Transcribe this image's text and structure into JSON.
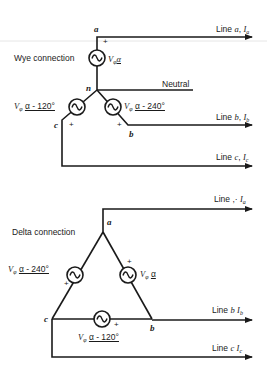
{
  "wye": {
    "title": "Wye connection",
    "nodes": {
      "a": "a",
      "b": "b",
      "c": "c",
      "n": "n"
    },
    "neutral_label": "Neutral",
    "lines": [
      {
        "name": "Line a",
        "current": "I",
        "sub": "a",
        "text_prefix": "Line ",
        "var": "a",
        "sep": ", "
      },
      {
        "name": "Line b",
        "current": "I",
        "sub": "b",
        "text_prefix": "Line ",
        "var": "b",
        "sep": ", "
      },
      {
        "name": "Line c",
        "current": "I",
        "sub": "c",
        "text_prefix": "Line ",
        "var": "c",
        "sep": ", "
      }
    ],
    "sources": [
      {
        "id": "Va",
        "magnitude": "V",
        "magnitude_sub": "φ",
        "angle": "α"
      },
      {
        "id": "Vc",
        "magnitude": "V",
        "magnitude_sub": "φ",
        "angle": "α - 120°"
      },
      {
        "id": "Vb",
        "magnitude": "V",
        "magnitude_sub": "φ",
        "angle": "α - 240°"
      }
    ],
    "polarity": "+"
  },
  "delta": {
    "title": "Delta connection",
    "nodes": {
      "a": "a",
      "b": "b",
      "c": "c"
    },
    "lines": [
      {
        "name": "Line a",
        "text_prefix": "Line ,· ",
        "current": "I",
        "sub": "a"
      },
      {
        "name": "Line b",
        "text_prefix": "Line ",
        "var": "b",
        "current": "I",
        "sub": "b"
      },
      {
        "name": "Line c",
        "text_prefix": "Line ",
        "var": "c",
        "current": "I",
        "sub": "c"
      }
    ],
    "sources": [
      {
        "id": "Vca",
        "magnitude": "V",
        "magnitude_sub": "φ",
        "angle": "α - 240°"
      },
      {
        "id": "Vab",
        "magnitude": "V",
        "magnitude_sub": "φ",
        "angle": "α"
      },
      {
        "id": "Vbc",
        "magnitude": "V",
        "magnitude_sub": "φ",
        "angle": "α - 120°"
      }
    ],
    "polarity": "+"
  },
  "colors": {
    "ink": "#1a1a1a",
    "background": "#ffffff",
    "scan_line": "#e4e4e4"
  }
}
